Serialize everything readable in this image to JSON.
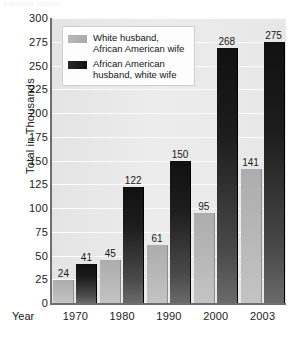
{
  "figure": {
    "top_sliver_text": "interracial couples"
  },
  "chart_data": {
    "type": "bar",
    "title": "",
    "xlabel": "Year",
    "ylabel": "Total in Thousands",
    "categories": [
      "1970",
      "1980",
      "1990",
      "2000",
      "2003"
    ],
    "series": [
      {
        "name": "White husband, African American wife",
        "color": "#b3b3b3",
        "values": [
          24,
          45,
          61,
          95,
          141
        ]
      },
      {
        "name": "African American husband, white wife",
        "color": "#151515",
        "values": [
          41,
          122,
          150,
          268,
          275
        ]
      }
    ],
    "ylim": [
      0,
      300
    ],
    "yticks": [
      0,
      25,
      50,
      75,
      100,
      125,
      150,
      175,
      200,
      225,
      250,
      275,
      300
    ],
    "ytick_labels": [
      "0",
      "25",
      "50",
      "75",
      "100",
      "125",
      "150",
      "175",
      "200",
      "225",
      "250",
      "275",
      "300"
    ],
    "grid": true,
    "legend_position": "top-left",
    "legend": [
      {
        "label_line1": "White husband,",
        "label_line2": "African American wife",
        "swatch": "light"
      },
      {
        "label_line1": "African American",
        "label_line2": "husband, white wife",
        "swatch": "dark"
      }
    ]
  }
}
